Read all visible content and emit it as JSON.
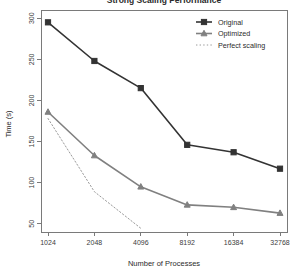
{
  "chart_data": {
    "type": "line",
    "title": "Strong Scaling Performance",
    "xlabel": "Number of Processes",
    "ylabel": "Time (s)",
    "x": [
      1024,
      2048,
      4096,
      8192,
      16384,
      32768
    ],
    "xtick_labels": [
      "1024",
      "2048",
      "4096",
      "8192",
      "16384",
      "32768"
    ],
    "ytick_values": [
      50,
      100,
      150,
      200,
      250,
      300
    ],
    "ytick_labels": [
      "50",
      "100",
      "150",
      "200",
      "250",
      "300"
    ],
    "ylim": [
      40,
      310
    ],
    "grid": false,
    "legend_position": "top-right",
    "series": [
      {
        "name": "Original",
        "values": [
          295,
          248,
          215,
          146,
          137,
          117
        ],
        "color": "#333333",
        "marker": "square",
        "linestyle": "solid"
      },
      {
        "name": "Optimized",
        "values": [
          186,
          133,
          95,
          73,
          70,
          63
        ],
        "color": "#808080",
        "marker": "triangle",
        "linestyle": "solid"
      },
      {
        "name": "Perfect scaling",
        "values": [
          178,
          89,
          44.5,
          null,
          null,
          null
        ],
        "color": "#9a9a9a",
        "marker": "none",
        "linestyle": "dotted"
      }
    ]
  },
  "legend": {
    "entries": [
      {
        "label": "Original"
      },
      {
        "label": "Optimized"
      },
      {
        "label": "Perfect scaling"
      }
    ]
  }
}
